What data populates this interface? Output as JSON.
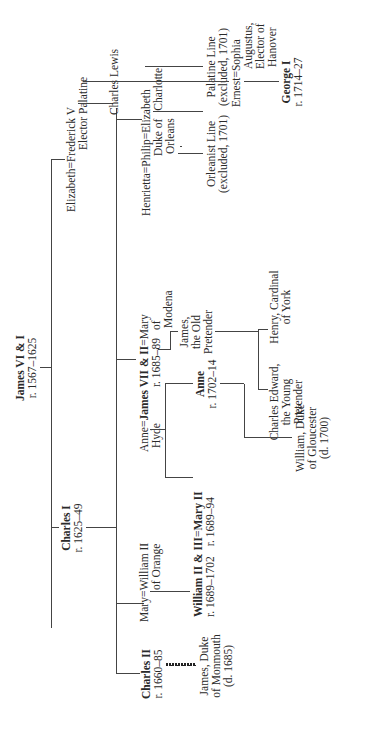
{
  "nodes": {
    "james_vi_i": {
      "name": "James VI & I",
      "reign": "r. 1567–1625"
    },
    "charles_i": {
      "name": "Charles I",
      "reign": "r. 1625–49"
    },
    "elizabeth": {
      "name": "Elizabeth"
    },
    "frederick_v": {
      "name": "Frederick V",
      "title": "Elector Palatine"
    },
    "charles_lewis": {
      "name": "Charles Lewis"
    },
    "elizabeth_charlotte": {
      "name": "Elizabeth",
      "name2": "Charlotte"
    },
    "henrietta": {
      "name": "Henrietta"
    },
    "philip": {
      "name": "Philip",
      "title1": "Duke of",
      "title2": "Orleans"
    },
    "orleanist_line": {
      "name": "Orleanist Line",
      "note": "(excluded, 1701)"
    },
    "palatine_line": {
      "name": "Palatine Line",
      "note": "(excluded, 1701)"
    },
    "ernest_augustus": {
      "name": "Ernest",
      "title1": "Augustus,",
      "title2": "Elector of",
      "title3": "Hanover"
    },
    "sophia": {
      "name": "Sophia"
    },
    "george_i": {
      "name": "George I",
      "reign": "r. 1714–27"
    },
    "anne_hyde": {
      "name": "Anne",
      "name2": "Hyde"
    },
    "james_vii_ii": {
      "name": "James VII & II",
      "reign": "r. 1685–89"
    },
    "mary_of_modena": {
      "name": "Mary",
      "name2": "of",
      "name3": "Modena"
    },
    "james_old_pretender": {
      "line1": "James,",
      "line2": "the Old",
      "line3": "Pretender"
    },
    "charles_edward": {
      "line1": "Charles Edward,",
      "line2": "the Young",
      "line3": "Pretender"
    },
    "henry_cardinal": {
      "line1": "Henry, Cardinal",
      "line2": "of York"
    },
    "anne": {
      "name": "Anne",
      "reign": "r. 1702–14"
    },
    "mary_ii": {
      "name": "Mary II",
      "reign": "r. 1689–94"
    },
    "william_gloucester": {
      "line1": "William, Duke",
      "line2": "of Gloucester",
      "line3": "(d. 1700)"
    },
    "mary": {
      "name": "Mary"
    },
    "william_ii_orange": {
      "name": "William II",
      "title": "of Orange"
    },
    "william_iii": {
      "name": "William II & III",
      "reign": "r. 1689–1702"
    },
    "charles_ii": {
      "name": "Charles II",
      "reign": "r. 1660–85"
    },
    "james_monmouth": {
      "line1": "James, Duke",
      "line2": "of Monmouth",
      "line3": "(d. 1685)"
    }
  },
  "marriage_symbol": "="
}
